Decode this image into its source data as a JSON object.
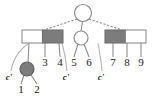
{
  "diagram": {
    "type": "tree-diagram",
    "width": 159,
    "height": 105,
    "colors": {
      "stroke": "#8c8c8c",
      "dark_fill": "#7c7c7c",
      "light_fill": "#ffffff",
      "text": "#1a1a1a",
      "background": "#ffffff"
    },
    "nodes": [
      {
        "id": "root",
        "shape": "circle",
        "fill": "light",
        "cx": 83,
        "cy": 13,
        "r": 8.5
      },
      {
        "id": "left-block",
        "shape": "rectangle",
        "x": 22,
        "y": 30,
        "width": 41,
        "height": 13,
        "cells": [
          {
            "fill": "light"
          },
          {
            "fill": "dark"
          }
        ]
      },
      {
        "id": "middle-circle",
        "shape": "circle",
        "fill": "light",
        "cx": 81,
        "cy": 38,
        "r": 7
      },
      {
        "id": "right-block",
        "shape": "rectangle",
        "x": 105,
        "y": 30,
        "width": 41,
        "height": 13,
        "cells": [
          {
            "fill": "dark"
          },
          {
            "fill": "light"
          }
        ]
      },
      {
        "id": "dark-leaf-circle",
        "shape": "circle",
        "fill": "dark",
        "cx": 27,
        "cy": 69,
        "r": 7
      }
    ],
    "edges": [
      {
        "from": "root",
        "to": "left-block",
        "style": "dashed"
      },
      {
        "from": "root",
        "to": "middle-circle",
        "style": "solid"
      },
      {
        "from": "root",
        "to": "right-block",
        "style": "dashed"
      },
      {
        "from": "left-block",
        "to": "dark-leaf-circle",
        "style": "solid"
      },
      {
        "from": "left-block",
        "to": "leaf-3",
        "style": "solid"
      },
      {
        "from": "left-block",
        "to": "leaf-4",
        "style": "solid"
      },
      {
        "from": "middle-circle",
        "to": "leaf-5",
        "style": "solid"
      },
      {
        "from": "middle-circle",
        "to": "leaf-6",
        "style": "solid"
      },
      {
        "from": "right-block",
        "to": "leaf-7",
        "style": "solid"
      },
      {
        "from": "right-block",
        "to": "leaf-8",
        "style": "solid"
      },
      {
        "from": "right-block",
        "to": "leaf-9",
        "style": "solid"
      },
      {
        "from": "dark-leaf-circle",
        "to": "leaf-1",
        "style": "solid"
      },
      {
        "from": "dark-leaf-circle",
        "to": "leaf-2",
        "style": "solid"
      }
    ],
    "leaf_labels": [
      {
        "id": "leaf-1",
        "text": "1",
        "x": 21,
        "y": 89
      },
      {
        "id": "leaf-2",
        "text": "2",
        "x": 37,
        "y": 89
      },
      {
        "id": "leaf-3",
        "text": "3",
        "x": 45,
        "y": 62
      },
      {
        "id": "leaf-4",
        "text": "4",
        "x": 60,
        "y": 62
      },
      {
        "id": "leaf-5",
        "text": "5",
        "x": 74,
        "y": 62
      },
      {
        "id": "leaf-6",
        "text": "6",
        "x": 89,
        "y": 62
      },
      {
        "id": "leaf-7",
        "text": "7",
        "x": 113,
        "y": 62
      },
      {
        "id": "leaf-8",
        "text": "8",
        "x": 127,
        "y": 62
      },
      {
        "id": "leaf-9",
        "text": "9",
        "x": 141,
        "y": 62
      }
    ],
    "marker_labels": [
      {
        "id": "marker-c1",
        "text": "c'",
        "x": 9,
        "y": 77
      },
      {
        "id": "marker-c2",
        "text": "c'",
        "x": 66,
        "y": 77
      },
      {
        "id": "marker-c3",
        "text": "c'",
        "x": 101,
        "y": 77
      }
    ],
    "marker_curves": [
      {
        "id": "curve-c1",
        "path": "M 27,48 C 20,52 14,58 11,68"
      },
      {
        "id": "curve-c2",
        "path": "M 62,48 C 64,55 66,62 67,68"
      },
      {
        "id": "curve-c3",
        "path": "M 98,48 C 99,55 101,62 102,68"
      }
    ]
  }
}
